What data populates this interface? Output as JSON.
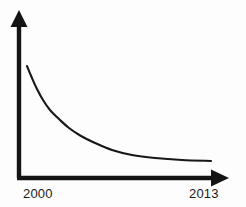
{
  "chart_data": {
    "type": "line",
    "title": "",
    "subtitle": "",
    "xlabel": "",
    "ylabel": "",
    "grid": false,
    "legend": null,
    "axis_style": "arrow-axes",
    "xlim": [
      2000,
      2013
    ],
    "ylim": [
      0,
      100
    ],
    "tick_labels": {
      "x": [
        "2000",
        "2013"
      ],
      "y": []
    },
    "series": [
      {
        "name": "decay",
        "x": [
          2000.0,
          2000.6,
          2001.2,
          2001.9,
          2002.7,
          2003.6,
          2004.6,
          2005.7,
          2006.9,
          2008.2,
          2009.5,
          2010.8,
          2012.0,
          2013.0
        ],
        "values": [
          85,
          74,
          64,
          55,
          47,
          40,
          34,
          29,
          25,
          21,
          19,
          17,
          16,
          15
        ],
        "points_px": [
          [
            27,
            66
          ],
          [
            32,
            78
          ],
          [
            37,
            89
          ],
          [
            43,
            100
          ],
          [
            50,
            110
          ],
          [
            59,
            119
          ],
          [
            69,
            128
          ],
          [
            81,
            136
          ],
          [
            95,
            143
          ],
          [
            112,
            150
          ],
          [
            132,
            155
          ],
          [
            155,
            158
          ],
          [
            182,
            160
          ],
          [
            211,
            161
          ]
        ]
      }
    ]
  },
  "axes": {
    "x_axis": {
      "name": "horizontal-axis",
      "start_px": [
        19,
        178
      ],
      "end_px": [
        228,
        178
      ],
      "thickness": 4,
      "arrowhead": true
    },
    "y_axis": {
      "name": "vertical-axis",
      "start_px": [
        19,
        178
      ],
      "end_px": [
        19,
        11
      ],
      "thickness": 4,
      "arrowhead": true
    }
  },
  "labels": {
    "start_year": "2000",
    "end_year": "2013"
  },
  "colors": {
    "background": "#fdfdfd",
    "axis": "#141414",
    "curve": "#171717",
    "text": "#1a1a1a"
  }
}
